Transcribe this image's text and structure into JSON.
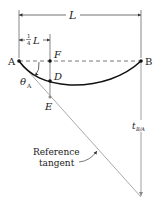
{
  "diagram": {
    "type": "beam-deflection-tangent",
    "points": {
      "A": {
        "label": "A",
        "x": 19,
        "y": 61
      },
      "F": {
        "label": "F",
        "x": 50,
        "y": 61
      },
      "B": {
        "label": "B",
        "x": 141,
        "y": 61
      },
      "D": {
        "label": "D",
        "x": 50,
        "y": 81
      },
      "E": {
        "label": "E",
        "x": 50,
        "y": 97
      }
    },
    "dimensions": {
      "span": {
        "label": "L"
      },
      "quarter": {
        "numerator": "1",
        "denominator": "4",
        "symbol": "L"
      }
    },
    "angle": {
      "symbol": "θ",
      "subscript": "A"
    },
    "deviation": {
      "symbol": "t",
      "subscript": "B/A"
    },
    "annotation": {
      "line1": "Reference",
      "line2": "tangent"
    },
    "colors": {
      "beam": "#111111",
      "tangent": "#aaaaaa",
      "dashed": "#555555",
      "dimension": "#333333",
      "label_gray": "#666666"
    }
  }
}
